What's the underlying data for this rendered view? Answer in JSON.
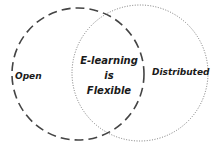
{
  "diagram": {
    "type": "venn",
    "sets": [
      {
        "label": "Open",
        "border_style": "dashed"
      },
      {
        "label": "Distributed",
        "border_style": "dotted"
      }
    ],
    "intersection": {
      "lines": [
        "E-learning",
        "is",
        "Flexible"
      ]
    },
    "colors": {
      "stroke_left": "#444444",
      "stroke_right": "#777777",
      "text": "#1a1a1a",
      "background": "#ffffff"
    }
  }
}
